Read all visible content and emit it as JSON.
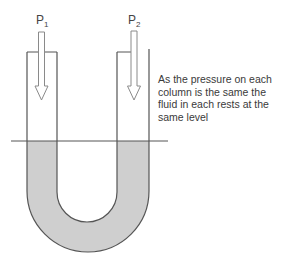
{
  "diagram": {
    "type": "u-tube-manometer",
    "labels": {
      "p1": {
        "main": "P",
        "sub": "1"
      },
      "p2": {
        "main": "P",
        "sub": "2"
      }
    },
    "caption": "As the pressure on each column is the same the fluid in each rests at the same level",
    "colors": {
      "fluid": "#cfcfcf",
      "outline": "#555555",
      "arrow": "#8a8a8a",
      "level_line": "#555555"
    }
  }
}
